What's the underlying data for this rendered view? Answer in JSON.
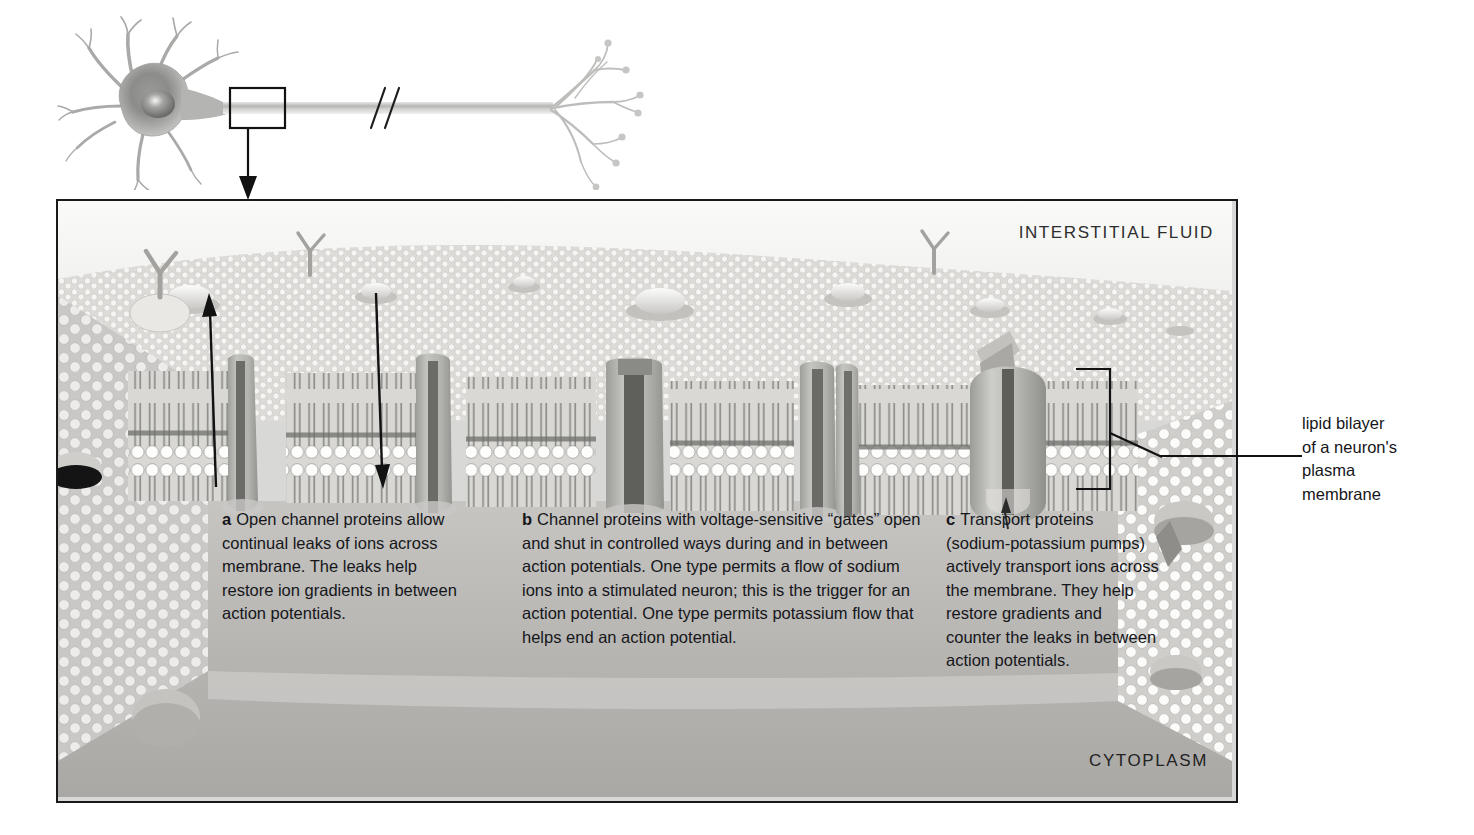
{
  "figure": {
    "title": "Lipid bilayer of a neuron's plasma membrane",
    "neuron": {
      "name": "neuron-illustration",
      "callout_box": "axon-membrane-region",
      "break_mark": "//"
    },
    "frame": {
      "top_label": "INTERSTITIAL FLUID",
      "bottom_label": "CYTOPLASM"
    },
    "annotation": {
      "line1": "lipid bilayer",
      "line2": "of a neuron's",
      "line3": "plasma",
      "line4": "membrane"
    },
    "captions": [
      {
        "marker": "a",
        "text": "Open channel proteins allow continual leaks of ions across membrane. The leaks help restore ion gradients in between action potentials."
      },
      {
        "marker": "b",
        "text": "Channel proteins with voltage-sensitive “gates” open and shut in controlled ways during and in between action potentials. One type permits a flow of sodium ions into a stimulated neuron; this is the trigger for an action potential. One type permits potassium flow that helps end an action potential."
      },
      {
        "marker": "c",
        "text": "Transport proteins (sodium-potassium pumps) actively transport ions across the membrane. They help restore gradients and counter the leaks in between action potentials."
      }
    ],
    "arrows": [
      {
        "name": "ion-leak-outward-arrow",
        "direction": "up"
      },
      {
        "name": "ion-leak-inward-arrow",
        "direction": "down"
      }
    ],
    "colors": {
      "ink": "#16161a",
      "frame_border": "#1a1a1a",
      "interstitial_fluid": "#f2f2f0",
      "cytoplasm": "#b9b9b6",
      "membrane_surface": "#d5d5d2",
      "protein_grey": "#b0b0ad",
      "channel_dark": "#6e6e6b",
      "lipid_head": "#fbfbfa"
    }
  }
}
